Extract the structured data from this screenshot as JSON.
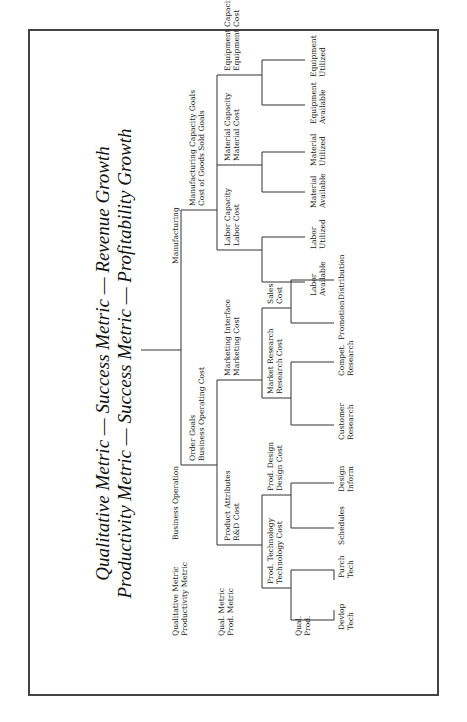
{
  "title": {
    "line1": "Qualitative Metric — Success Metric — Revenue Growth",
    "line2": "Productivity Metric — Success Metric — Profitability Growth"
  },
  "legend": {
    "level1": [
      "Qualitative Metric",
      "Productivity Metric"
    ],
    "level2": [
      "Qual. Metric",
      "Prod. Metric"
    ],
    "level3": [
      "Qual.",
      "Prod."
    ]
  },
  "tree": {
    "business_operation": {
      "label": "Business Operation",
      "metrics": [
        "Order Goals",
        "Business Operating Cost"
      ],
      "product_attributes": {
        "metrics": [
          "Product Attributes",
          "R&D Cost"
        ],
        "prod_technology": {
          "metrics": [
            "Prod. Technology",
            "Technology Cost"
          ],
          "leaves": [
            [
              "Devlop",
              "Tech"
            ],
            [
              "Purch",
              "Tech"
            ]
          ]
        },
        "prod_design": {
          "metrics": [
            "Prod. Design",
            "Design Cost"
          ],
          "leaves": [
            [
              "Schedules"
            ],
            [
              "Design",
              "Inform"
            ]
          ]
        }
      },
      "marketing_interface": {
        "metrics": [
          "Marketing Interface",
          "Marketing Cost"
        ],
        "market_research": {
          "metrics": [
            "Market Research",
            "Research Cost"
          ],
          "leaves": [
            [
              "Customer",
              "Research"
            ],
            [
              "Compet.",
              "Research"
            ]
          ]
        },
        "sales": {
          "metrics": [
            "Sales",
            "Cost"
          ],
          "leaves": [
            [
              "Promotion"
            ],
            [
              "Distribution"
            ]
          ]
        }
      }
    },
    "manufacturing": {
      "label": "Manufacturing",
      "metrics": [
        "Manufacturing Capacity Goals",
        "Cost of Goods Sold Goals"
      ],
      "labor": {
        "metrics": [
          "Labor Capacity",
          "Labor Cost"
        ],
        "leaves": [
          [
            "Labor",
            "Available"
          ],
          [
            "Labor",
            "Utilized"
          ]
        ]
      },
      "material": {
        "metrics": [
          "Material Capacity",
          "Material Cost"
        ],
        "leaves": [
          [
            "Material",
            "Available"
          ],
          [
            "Material",
            "Utilized"
          ]
        ]
      },
      "equipment": {
        "metrics": [
          "Equipment Capacity",
          "Equipment Cost"
        ],
        "leaves": [
          [
            "Equipment",
            "Available"
          ],
          [
            "Equipment",
            "Utilized"
          ]
        ]
      }
    }
  },
  "colors": {
    "line": "#333333",
    "text": "#222222",
    "frame": "#444444",
    "background": "#ffffff"
  }
}
